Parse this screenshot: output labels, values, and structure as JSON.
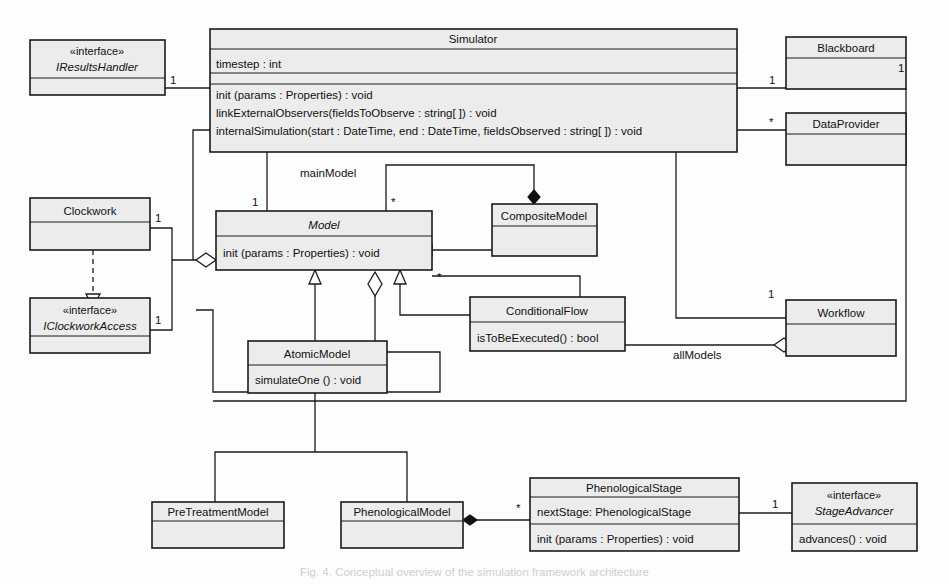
{
  "diagram": {
    "type": "uml-class-diagram",
    "caption": "Fig. 4. Conceptual overview of the simulation framework architecture",
    "colors": {
      "box_fill": "#ececec",
      "stroke": "#1b1b1b",
      "background": "#fdfdfd"
    },
    "classes": [
      {
        "id": "iresultshandler",
        "stereotype": "«interface»",
        "name": "IResultsHandler",
        "abstract": true,
        "attributes": [],
        "operations": []
      },
      {
        "id": "simulator",
        "stereotype": "",
        "name": "Simulator",
        "abstract": false,
        "attributes": [
          "timestep : int"
        ],
        "operations": [
          "init (params : Properties) : void",
          "linkExternalObservers(fieldsToObserve : string[ ]) : void",
          "internalSimulation(start : DateTime, end : DateTime, fieldsObserved : string[ ]) : void"
        ]
      },
      {
        "id": "blackboard",
        "stereotype": "",
        "name": "Blackboard",
        "abstract": false,
        "attributes": [],
        "operations": []
      },
      {
        "id": "dataprovider",
        "stereotype": "",
        "name": "DataProvider",
        "abstract": false,
        "attributes": [],
        "operations": []
      },
      {
        "id": "clockwork",
        "stereotype": "",
        "name": "Clockwork",
        "abstract": false,
        "attributes": [],
        "operations": []
      },
      {
        "id": "iclockworkaccess",
        "stereotype": "«interface»",
        "name": "IClockworkAccess",
        "abstract": true,
        "attributes": [],
        "operations": []
      },
      {
        "id": "model",
        "stereotype": "",
        "name": "Model",
        "abstract": true,
        "attributes": [],
        "operations": [
          "init (params : Properties) : void"
        ]
      },
      {
        "id": "compositemodel",
        "stereotype": "",
        "name": "CompositeModel",
        "abstract": false,
        "attributes": [],
        "operations": []
      },
      {
        "id": "conditionalflow",
        "stereotype": "",
        "name": "ConditionalFlow",
        "abstract": false,
        "attributes": [],
        "operations": [
          "isToBeExecuted() : bool"
        ]
      },
      {
        "id": "workflow",
        "stereotype": "",
        "name": "Workflow",
        "abstract": false,
        "attributes": [],
        "operations": []
      },
      {
        "id": "atomicmodel",
        "stereotype": "",
        "name": "AtomicModel",
        "abstract": false,
        "attributes": [],
        "operations": [
          "simulateOne () : void"
        ]
      },
      {
        "id": "pretreatmentmodel",
        "stereotype": "",
        "name": "PreTreatmentModel",
        "abstract": false,
        "attributes": [],
        "operations": []
      },
      {
        "id": "phenologicalmodel",
        "stereotype": "",
        "name": "PhenologicalModel",
        "abstract": false,
        "attributes": [],
        "operations": []
      },
      {
        "id": "phenologicalstage",
        "stereotype": "",
        "name": "PhenologicalStage",
        "abstract": false,
        "attributes": [
          "nextStage: PhenologicalStage"
        ],
        "operations": [
          "init (params : Properties) : void"
        ]
      },
      {
        "id": "stageadvancer",
        "stereotype": "«interface»",
        "name": "StageAdvancer",
        "abstract": true,
        "attributes": [],
        "operations": [
          "advances() : void"
        ]
      }
    ],
    "multiplicities": [
      {
        "id": "m-iresultshandler",
        "text": "1"
      },
      {
        "id": "m-blackboard-left",
        "text": "1"
      },
      {
        "id": "m-blackboard-right",
        "text": "1"
      },
      {
        "id": "m-dataprovider",
        "text": "*"
      },
      {
        "id": "m-clockwork",
        "text": "1"
      },
      {
        "id": "m-iclockworkaccess",
        "text": "1"
      },
      {
        "id": "m-mainmodel",
        "text": "1"
      },
      {
        "id": "m-compositemodel",
        "text": "*"
      },
      {
        "id": "m-model-allmodels",
        "text": "*"
      },
      {
        "id": "m-workflow",
        "text": "1"
      },
      {
        "id": "m-phenostage",
        "text": "*"
      },
      {
        "id": "m-stageadvancer",
        "text": "1"
      }
    ],
    "role_labels": [
      {
        "id": "role-mainmodel",
        "text": "mainModel"
      },
      {
        "id": "role-allmodels",
        "text": "allModels"
      }
    ]
  }
}
